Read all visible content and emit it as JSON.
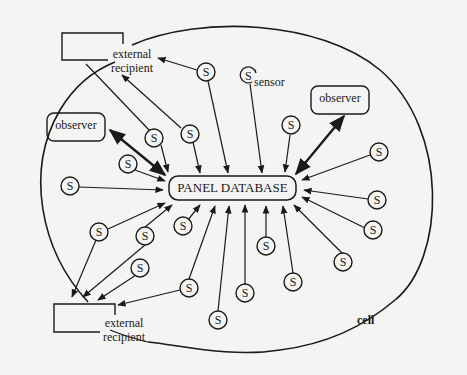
{
  "diagram": {
    "central": {
      "label": "PANEL DATABASE"
    },
    "cell_label": "cell",
    "sensor_label": "sensor",
    "sensor_symbol": "S",
    "observers": [
      {
        "label": "observer"
      },
      {
        "label": "observer"
      }
    ],
    "external_recipients": [
      {
        "line1": "external",
        "line2": "recipient"
      },
      {
        "line1": "external",
        "line2": "recipient"
      }
    ],
    "colors": {
      "ink": "#1a1a1a",
      "paper": "#f4f4f2"
    }
  }
}
